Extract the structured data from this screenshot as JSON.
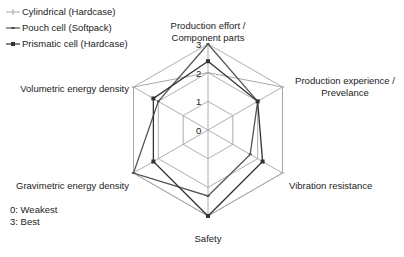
{
  "chart_data": {
    "type": "radar",
    "title": "",
    "axes": [
      "Production effort / Component parts",
      "Production experience / Prevelance",
      "Vibration resistance",
      "Safety",
      "Gravimetric energy density",
      "Volumetric energy density"
    ],
    "axis_label_lines": [
      [
        "Production effort /",
        "Component parts"
      ],
      [
        "Production experience /",
        "Prevelance"
      ],
      [
        "Vibration resistance"
      ],
      [
        "Safety"
      ],
      [
        "Gravimetric energy density"
      ],
      [
        "Volumetric energy density"
      ]
    ],
    "range": [
      0,
      3
    ],
    "ticks": [
      "0",
      "1",
      "2",
      "3"
    ],
    "grid": true,
    "legend_position": "top-left",
    "series": [
      {
        "name": "Cylindrical (Hardcase)",
        "color": "#a8a8a8",
        "marker": "plus",
        "values": [
          2,
          3,
          3,
          3,
          3,
          3
        ]
      },
      {
        "name": "Pouch cell (Softpack)",
        "color": "#555555",
        "marker": "dash",
        "values": [
          3,
          2,
          1.7,
          2.3,
          3,
          2
        ]
      },
      {
        "name": "Prismatic cell (Hardcase)",
        "color": "#333333",
        "marker": "square",
        "values": [
          2.4,
          2,
          2.2,
          3,
          2.2,
          2.2
        ]
      }
    ],
    "annotations": [
      "0: Weakest",
      "3: Best"
    ]
  },
  "legend": [
    {
      "label": "Cylindrical (Hardcase)"
    },
    {
      "label": "Pouch cell (Softpack)"
    },
    {
      "label": "Prismatic cell (Hardcase)"
    }
  ],
  "note": {
    "line1": "0: Weakest",
    "line2": "3: Best"
  }
}
